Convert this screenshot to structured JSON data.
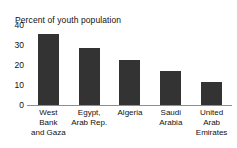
{
  "chart_data": {
    "type": "bar",
    "title": "Percent of youth population",
    "xlabel": "",
    "ylabel": "",
    "categories": [
      "West Bank and Gaza",
      "Egypt, Arab Rep.",
      "Algeria",
      "Saudi Arabia",
      "United Arab Emirates"
    ],
    "category_lines": [
      [
        "West",
        "Bank",
        "and Gaza"
      ],
      [
        "Egypt,",
        "Arab Rep."
      ],
      [
        "Algeria"
      ],
      [
        "Saudi",
        "Arabia"
      ],
      [
        "United",
        "Arab",
        "Emirates"
      ]
    ],
    "values": [
      33.5,
      27,
      21,
      16,
      11
    ],
    "ylim": [
      0,
      40
    ],
    "yticks": [
      40,
      30,
      20,
      10,
      0
    ],
    "grid": false,
    "legend": false,
    "bar_color": "#333333",
    "axis_color": "#8e8e8e",
    "background": "#ffffff"
  }
}
